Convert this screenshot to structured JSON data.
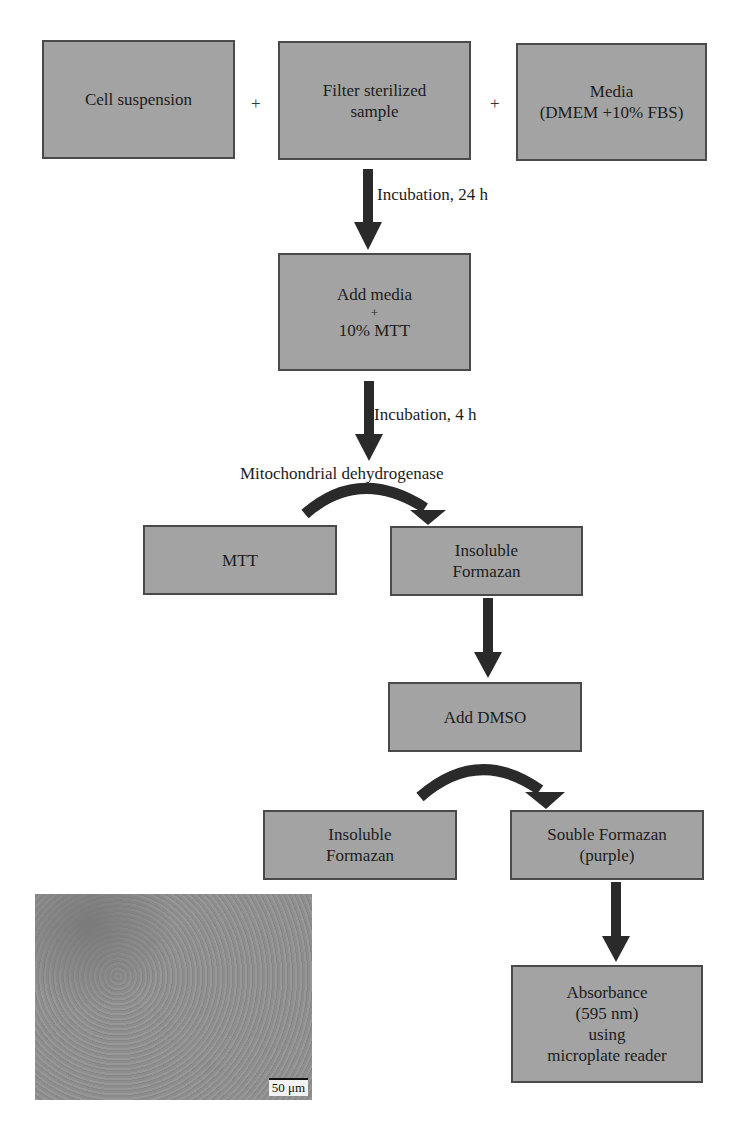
{
  "diagram": {
    "top_row": [
      {
        "lines": [
          "Cell suspension"
        ]
      },
      {
        "lines": [
          "Filter sterilized",
          "sample"
        ]
      },
      {
        "lines": [
          "Media",
          "(DMEM +10% FBS)"
        ]
      }
    ],
    "plus_sign": "+",
    "arrow_labels": {
      "incubation_24h": "Incubation, 24 h",
      "incubation_4h": "Incubation, 4 h",
      "enzyme": "Mitochondrial dehydrogenase"
    },
    "add_media_box": {
      "lines": [
        "Add media",
        "+",
        "10% MTT"
      ]
    },
    "mtt_box": {
      "lines": [
        "MTT"
      ]
    },
    "insoluble_formazan_1": {
      "lines": [
        "Insoluble",
        "Formazan"
      ]
    },
    "add_dmso_box": {
      "lines": [
        "Add DMSO"
      ]
    },
    "insoluble_formazan_2": {
      "lines": [
        "Insoluble",
        "Formazan"
      ]
    },
    "soluble_formazan_box": {
      "lines": [
        "Souble Formazan",
        "(purple)"
      ]
    },
    "absorbance_box": {
      "lines": [
        "Absorbance",
        "(595 nm)",
        "using",
        "microplate reader"
      ]
    },
    "micrograph": {
      "scale_bar": "50 μm"
    },
    "colors": {
      "box_fill": "#a3a3a3",
      "box_border": "#4a4a4a",
      "arrow": "#2a2a2a"
    }
  }
}
